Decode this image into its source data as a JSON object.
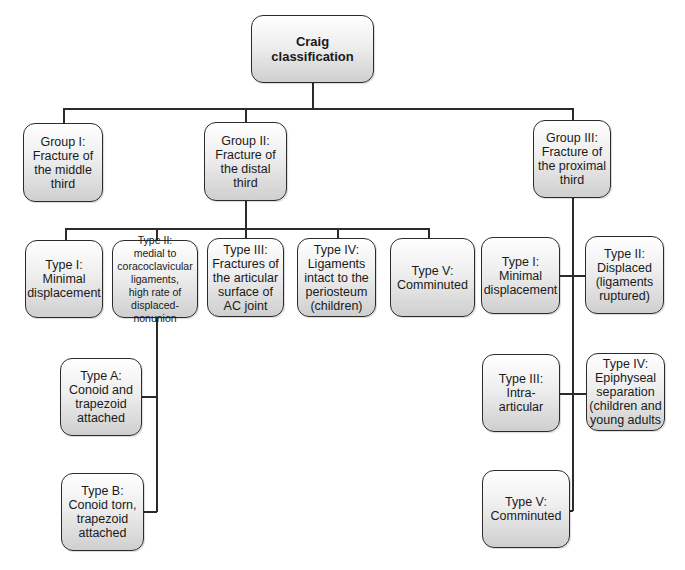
{
  "diagram": {
    "root": {
      "label": "Craig\nclassification"
    },
    "groups": [
      {
        "label": "Group  I:\nFracture of\nthe middle\nthird"
      },
      {
        "label": "Group II:\nFracture of\nthe distal\nthird"
      },
      {
        "label": "Group III:\nFracture of\nthe proximal\nthird"
      }
    ],
    "group2_types": [
      {
        "label": "Type I:\nMinimal\ndisplacement"
      },
      {
        "label": "Type II:\nmedial to\ncoracoclavicular\nligaments,\nhigh rate of displaced-\nnonunion"
      },
      {
        "label": "Type III:\nFractures of\nthe articular\nsurface of\nAC joint"
      },
      {
        "label": "Type IV:\nLigaments\nintact to the\nperiosteum\n(children)"
      },
      {
        "label": "Type V:\nComminuted"
      }
    ],
    "group2_type2_subtypes": [
      {
        "label": "Type A:\nConoid and\ntrapezoid\nattached"
      },
      {
        "label": "Type B:\nConoid  torn,\ntrapezoid\nattached"
      }
    ],
    "group3_types": [
      {
        "label": "Type I:\nMinimal\ndisplacement"
      },
      {
        "label": "Type II:\nDisplaced\n(ligaments\nruptured)"
      },
      {
        "label": "Type III:\nIntra-articular"
      },
      {
        "label": "Type IV:\nEpiphyseal\nseparation\n(children and\nyoung adults"
      },
      {
        "label": "Type V:\nComminuted"
      }
    ]
  },
  "colors": {
    "line": "#2b2b2b",
    "box_top": "#ffffff",
    "box_bottom": "#cfcfcf"
  }
}
